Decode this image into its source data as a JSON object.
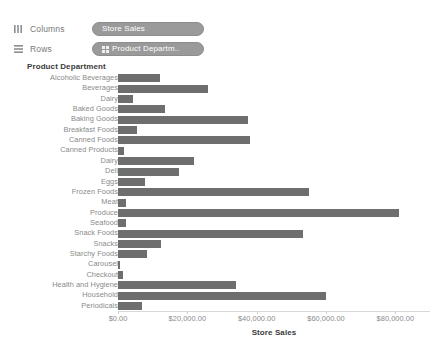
{
  "shelves": {
    "columns": {
      "label": "Columns",
      "icon": "columns-shelf-icon",
      "pill": {
        "text": "Store Sales",
        "color": "#9a9a9a"
      }
    },
    "rows": {
      "label": "Rows",
      "icon": "rows-shelf-icon",
      "pill": {
        "text": "Product Departm..",
        "color": "#9a9a9a",
        "icon": "dimension-grid-icon"
      }
    }
  },
  "chart_data": {
    "type": "bar",
    "orientation": "horizontal",
    "title": "",
    "row_header": "Product Department",
    "xlabel": "Store Sales",
    "ylabel": "Product Department",
    "xlim": [
      0,
      90000
    ],
    "grid": false,
    "legend": null,
    "bar_color": "#6e6e6e",
    "tick_labels": [
      "$0.00",
      "$20,000.00",
      "$40,000.00",
      "$60,000.00",
      "$80,000.00"
    ],
    "tick_values": [
      0,
      20000,
      40000,
      60000,
      80000
    ],
    "categories": [
      "Alcoholic Beverages",
      "Beverages",
      "Dairy",
      "Baked Goods",
      "Baking Goods",
      "Breakfast Foods",
      "Canned Foods",
      "Canned Products",
      "Dairy",
      "Deli",
      "Eggs",
      "Frozen Foods",
      "Meat",
      "Produce",
      "Seafood",
      "Snack Foods",
      "Snacks",
      "Starchy Foods",
      "Carousel",
      "Checkout",
      "Health and Hygiene",
      "Household",
      "Periodicals"
    ],
    "values": [
      12000,
      26000,
      4300,
      13500,
      37500,
      5600,
      38000,
      1700,
      22000,
      17500,
      7800,
      55000,
      2400,
      81000,
      2400,
      53500,
      12500,
      8500,
      700,
      1400,
      34000,
      60000,
      6800
    ]
  }
}
